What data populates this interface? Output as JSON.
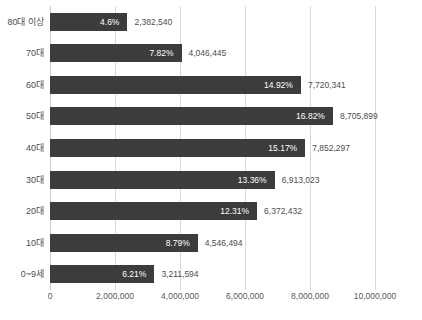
{
  "chart_data": {
    "type": "bar",
    "orientation": "horizontal",
    "title": "",
    "xlabel": "",
    "ylabel": "",
    "xlim": [
      0,
      10000000
    ],
    "grid": true,
    "legend": null,
    "bar_color": "#3c3c3c",
    "categories": [
      "0~9세",
      "10대",
      "20대",
      "30대",
      "40대",
      "50대",
      "60대",
      "70대",
      "80대 이상"
    ],
    "values": [
      3211594,
      4546494,
      6372432,
      6913023,
      7852297,
      8705899,
      7720341,
      4046445,
      2382540
    ],
    "value_labels": [
      "3,211,594",
      "4,546,494",
      "6,372,432",
      "6,913,023",
      "7,852,297",
      "8,705,899",
      "7,720,341",
      "4,046,445",
      "2,382,540"
    ],
    "percent_labels": [
      "6.21%",
      "8.79%",
      "12.31%",
      "13.36%",
      "15.17%",
      "16.82%",
      "14.92%",
      "7.82%",
      "4.6%"
    ],
    "percent_values": [
      6.21,
      8.79,
      12.31,
      13.36,
      15.17,
      16.82,
      14.92,
      7.82,
      4.6
    ],
    "xticks": [
      0,
      2000000,
      4000000,
      6000000,
      8000000,
      10000000
    ],
    "xtick_labels": [
      "0",
      "2,000,000",
      "4,000,000",
      "6,000,000",
      "8,000,000",
      "10,000,000"
    ]
  },
  "source_note": ""
}
